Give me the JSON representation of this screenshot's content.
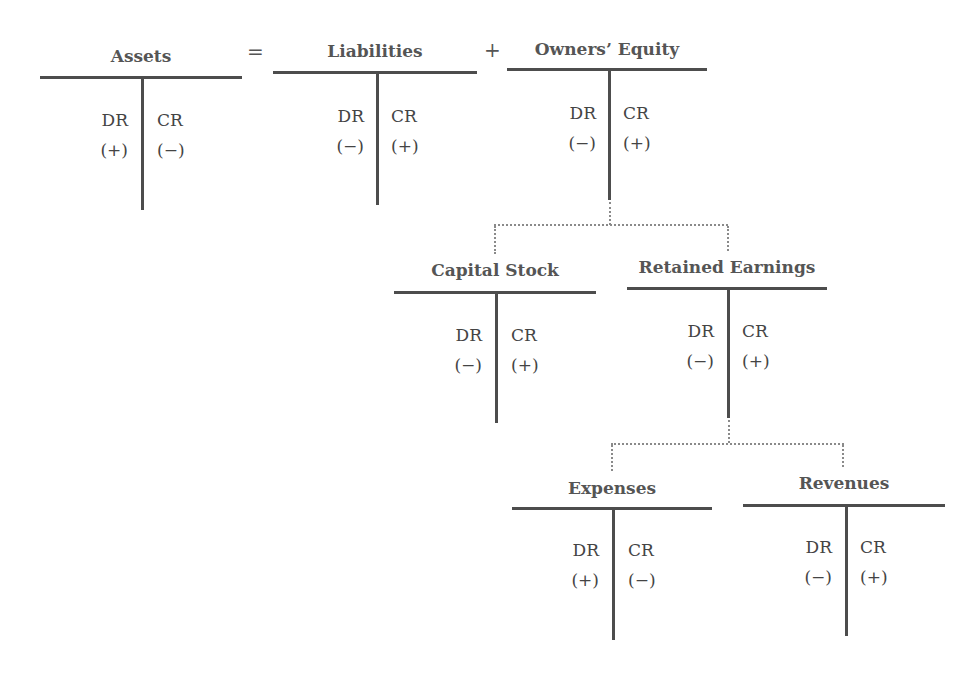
{
  "diagram": {
    "type": "t-account-hierarchy",
    "operators": {
      "equals": "=",
      "plus": "+"
    },
    "accounts": {
      "assets": {
        "title": "Assets",
        "dr_label": "DR",
        "cr_label": "CR",
        "dr_sign": "(+)",
        "cr_sign": "(−)"
      },
      "liabilities": {
        "title": "Liabilities",
        "dr_label": "DR",
        "cr_label": "CR",
        "dr_sign": "(−)",
        "cr_sign": "(+)"
      },
      "owners_equity": {
        "title": "Owners’ Equity",
        "dr_label": "DR",
        "cr_label": "CR",
        "dr_sign": "(−)",
        "cr_sign": "(+)"
      },
      "capital_stock": {
        "title": "Capital Stock",
        "dr_label": "DR",
        "cr_label": "CR",
        "dr_sign": "(−)",
        "cr_sign": "(+)"
      },
      "retained_earnings": {
        "title": "Retained Earnings",
        "dr_label": "DR",
        "cr_label": "CR",
        "dr_sign": "(−)",
        "cr_sign": "(+)"
      },
      "expenses": {
        "title": "Expenses",
        "dr_label": "DR",
        "cr_label": "CR",
        "dr_sign": "(+)",
        "cr_sign": "(−)"
      },
      "revenues": {
        "title": "Revenues",
        "dr_label": "DR",
        "cr_label": "CR",
        "dr_sign": "(−)",
        "cr_sign": "(+)"
      }
    },
    "equation": [
      "Assets",
      "=",
      "Liabilities",
      "+",
      "Owners’ Equity"
    ],
    "hierarchy": [
      {
        "parent": "Owners’ Equity",
        "children": [
          "Capital Stock",
          "Retained Earnings"
        ]
      },
      {
        "parent": "Retained Earnings",
        "children": [
          "Expenses",
          "Revenues"
        ]
      }
    ]
  }
}
